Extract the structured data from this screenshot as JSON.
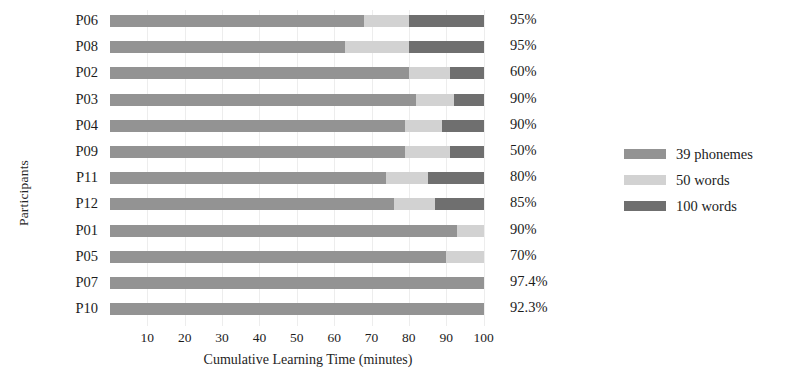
{
  "chart_data": {
    "type": "bar",
    "subtype": "stacked-horizontal",
    "title": "",
    "xlabel": "Cumulative Learning Time (minutes)",
    "ylabel": "Participants",
    "xlim": [
      0,
      106
    ],
    "xticks": [
      10,
      20,
      30,
      40,
      50,
      60,
      70,
      80,
      90,
      100
    ],
    "xticklabels": [
      "10",
      "20",
      "30",
      "40",
      "50",
      "60",
      "70",
      "80",
      "90",
      "100"
    ],
    "grid": "vertical-light",
    "legend_position": "right",
    "categories": [
      "P06",
      "P08",
      "P02",
      "P03",
      "P04",
      "P09",
      "P11",
      "P12",
      "P01",
      "P05",
      "P07",
      "P10"
    ],
    "series": [
      {
        "name": "39 phonemes",
        "color": "#939393",
        "values": [
          68,
          63,
          80,
          82,
          79,
          79,
          74,
          76,
          93,
          90,
          100,
          100
        ]
      },
      {
        "name": "50 words",
        "color": "#d2d2d2",
        "values": [
          12,
          17,
          11,
          10,
          10,
          12,
          11,
          11,
          7,
          10,
          0,
          0
        ]
      },
      {
        "name": "100 words",
        "color": "#6f6f6f",
        "values": [
          20,
          20,
          9,
          8,
          11,
          9,
          15,
          13,
          0,
          0,
          0,
          0
        ]
      }
    ],
    "totals": [
      100,
      100,
      100,
      100,
      100,
      100,
      100,
      100,
      100,
      100,
      100,
      100
    ],
    "point_labels": [
      "95%",
      "95%",
      "60%",
      "90%",
      "90%",
      "50%",
      "80%",
      "85%",
      "90%",
      "70%",
      "97.4%",
      "92.3%"
    ],
    "point_label_note": "accuracy value shown at end of each bar"
  },
  "axes": {
    "y_title": "Participants",
    "x_title": "Cumulative Learning Time (minutes)"
  },
  "rows": [
    {
      "label": "P06",
      "pct": "95%",
      "segments": [
        {
          "key": "phonemes",
          "v": 68
        },
        {
          "key": "w50",
          "v": 12
        },
        {
          "key": "w100",
          "v": 20
        }
      ]
    },
    {
      "label": "P08",
      "pct": "95%",
      "segments": [
        {
          "key": "phonemes",
          "v": 63
        },
        {
          "key": "w50",
          "v": 17
        },
        {
          "key": "w100",
          "v": 20
        }
      ]
    },
    {
      "label": "P02",
      "pct": "60%",
      "segments": [
        {
          "key": "phonemes",
          "v": 80
        },
        {
          "key": "w50",
          "v": 11
        },
        {
          "key": "w100",
          "v": 9
        }
      ]
    },
    {
      "label": "P03",
      "pct": "90%",
      "segments": [
        {
          "key": "phonemes",
          "v": 82
        },
        {
          "key": "w50",
          "v": 10
        },
        {
          "key": "w100",
          "v": 8
        }
      ]
    },
    {
      "label": "P04",
      "pct": "90%",
      "segments": [
        {
          "key": "phonemes",
          "v": 79
        },
        {
          "key": "w50",
          "v": 10
        },
        {
          "key": "w100",
          "v": 11
        }
      ]
    },
    {
      "label": "P09",
      "pct": "50%",
      "segments": [
        {
          "key": "phonemes",
          "v": 79
        },
        {
          "key": "w50",
          "v": 12
        },
        {
          "key": "w100",
          "v": 9
        }
      ]
    },
    {
      "label": "P11",
      "pct": "80%",
      "segments": [
        {
          "key": "phonemes",
          "v": 74
        },
        {
          "key": "w50",
          "v": 11
        },
        {
          "key": "w100",
          "v": 15
        }
      ]
    },
    {
      "label": "P12",
      "pct": "85%",
      "segments": [
        {
          "key": "phonemes",
          "v": 76
        },
        {
          "key": "w50",
          "v": 11
        },
        {
          "key": "w100",
          "v": 13
        }
      ]
    },
    {
      "label": "P01",
      "pct": "90%",
      "segments": [
        {
          "key": "phonemes",
          "v": 93
        },
        {
          "key": "w50",
          "v": 7
        },
        {
          "key": "w100",
          "v": 0
        }
      ]
    },
    {
      "label": "P05",
      "pct": "70%",
      "segments": [
        {
          "key": "phonemes",
          "v": 90
        },
        {
          "key": "w50",
          "v": 10
        },
        {
          "key": "w100",
          "v": 0
        }
      ]
    },
    {
      "label": "P07",
      "pct": "97.4%",
      "segments": [
        {
          "key": "phonemes",
          "v": 100
        },
        {
          "key": "w50",
          "v": 0
        },
        {
          "key": "w100",
          "v": 0
        }
      ]
    },
    {
      "label": "P10",
      "pct": "92.3%",
      "segments": [
        {
          "key": "phonemes",
          "v": 100
        },
        {
          "key": "w50",
          "v": 0
        },
        {
          "key": "w100",
          "v": 0
        }
      ]
    }
  ],
  "legend": {
    "items": [
      {
        "label": "39 phonemes",
        "color": "#939393",
        "key": "phonemes"
      },
      {
        "label": "50 words",
        "color": "#d2d2d2",
        "key": "w50"
      },
      {
        "label": "100 words",
        "color": "#6f6f6f",
        "key": "w100"
      }
    ]
  },
  "colors": {
    "phonemes": "#939393",
    "w50": "#d2d2d2",
    "w100": "#6f6f6f",
    "background": "#ffffff",
    "text": "#1c1c1c",
    "gridline": "#ededed"
  }
}
